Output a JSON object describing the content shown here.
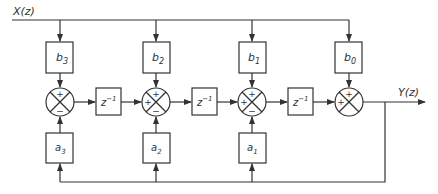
{
  "diagram": {
    "input_label": "X(z)",
    "output_label": "Y(z)",
    "colors": {
      "line": "#333333",
      "background": "#ffffff"
    },
    "b_blocks": [
      {
        "label": "b3",
        "base": "b",
        "sub": "3"
      },
      {
        "label": "b2",
        "base": "b",
        "sub": "2"
      },
      {
        "label": "b1",
        "base": "b",
        "sub": "1"
      },
      {
        "label": "b0",
        "base": "b",
        "sub": "0"
      }
    ],
    "a_blocks": [
      {
        "label": "a3",
        "base": "a",
        "sub": "3"
      },
      {
        "label": "a2",
        "base": "a",
        "sub": "2"
      },
      {
        "label": "a1",
        "base": "a",
        "sub": "1"
      }
    ],
    "delay_blocks": [
      {
        "base": "z",
        "sup": "−1"
      },
      {
        "base": "z",
        "sup": "−1"
      },
      {
        "base": "z",
        "sup": "−1"
      }
    ],
    "summers": [
      {
        "top": "+",
        "left": "",
        "bottom": "−"
      },
      {
        "top": "+",
        "left": "+",
        "bottom": "−"
      },
      {
        "top": "+",
        "left": "+",
        "bottom": "−"
      },
      {
        "top": "+",
        "left": "+",
        "bottom": ""
      }
    ]
  }
}
